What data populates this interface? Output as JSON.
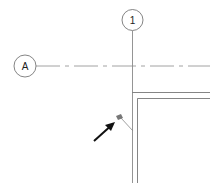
{
  "drawing": {
    "grid_bubbles": [
      {
        "label": "1",
        "orientation": "vertical"
      },
      {
        "label": "A",
        "orientation": "horizontal"
      }
    ],
    "colors": {
      "line": "#555555",
      "grid_line": "#888888",
      "arrow": "#111111",
      "tag": "#777777"
    }
  }
}
